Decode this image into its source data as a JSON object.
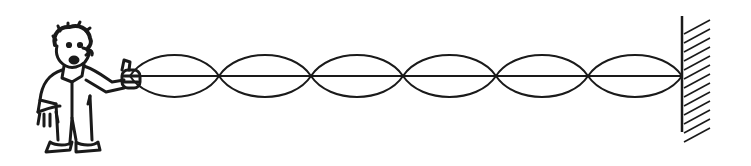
{
  "diagram": {
    "ink_color": "#1a1a1a",
    "background": "#ffffff",
    "person": {
      "label": "person holding string end",
      "hand_x": 140,
      "hand_y": 76
    },
    "string": {
      "y": 76,
      "x_start": 130,
      "x_end": 682
    },
    "nodes_x": [
      130,
      219,
      311,
      403,
      496,
      588,
      682
    ],
    "loop_count": 6,
    "loop_amplitude": 21,
    "wall": {
      "x": 682,
      "y_top": 16,
      "y_bottom": 132,
      "hatch_width": 28
    }
  }
}
